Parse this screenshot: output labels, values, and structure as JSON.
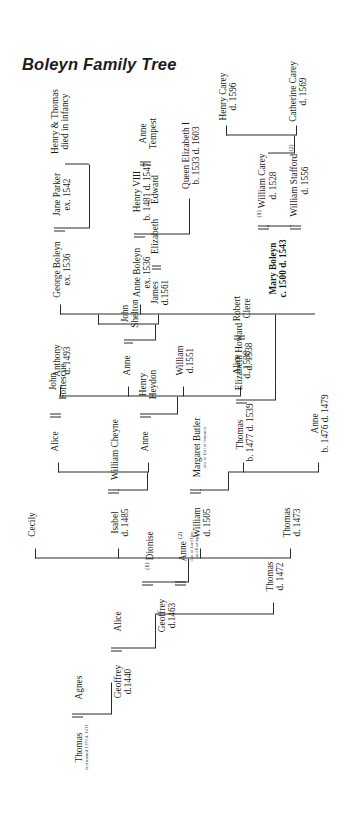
{
  "document": {
    "title": "Boleyn Family Tree",
    "type": "genealogical-chart",
    "orientation": "rotated-90-counterclockwise"
  },
  "people": {
    "thomas_boleyn_1": {
      "name": "Thomas",
      "note": "first named 1370 d. 1411"
    },
    "agnes": {
      "name": "Agnes"
    },
    "geoffrey_1440": {
      "name": "Geoffrey",
      "dates": "d.1440"
    },
    "alice": {
      "name": "Alice"
    },
    "geoffrey_1463": {
      "name": "Geoffrey",
      "dates": "d.1463"
    },
    "dionise": {
      "name": "Dionise",
      "order": "(1)"
    },
    "cecily": {
      "name": "Cecily"
    },
    "anne_hoo": {
      "name": "Anne",
      "order": "(2)",
      "note1": "dau. of Lord Hoo",
      "note2": "and Hastings"
    },
    "thomas_1472": {
      "name": "Thomas",
      "dates": "d. 1472"
    },
    "isabel_1485": {
      "name": "Isabel",
      "dates": "d. 1485"
    },
    "william_cheyne": {
      "name": "William Cheyne"
    },
    "anne_heydon": {
      "name": "Anne"
    },
    "henry_heydon": {
      "name": "Henry",
      "dates": "Heydon"
    },
    "alice_fortescue": {
      "name": "Alice"
    },
    "john_fortescue": {
      "name": "John",
      "dates": "Fortescue"
    },
    "william_1505": {
      "name": "William",
      "dates": "d. 1505"
    },
    "margaret_butler": {
      "name": "Margaret Butler",
      "note": "dau. of Earl of Ormonde"
    },
    "thomas_1473": {
      "name": "Thomas",
      "dates": "d. 1473"
    },
    "anthony_1493": {
      "name": "Anthony",
      "dates": "d. 1493"
    },
    "alice_1538": {
      "name": "Alice",
      "dates": "d. 1538"
    },
    "robert_clere": {
      "name": "Robert",
      "dates": "Clere"
    },
    "william_1551": {
      "name": "William",
      "dates": "d.1551"
    },
    "anne_shelton": {
      "name": "Anne"
    },
    "john_shelton": {
      "name": "John",
      "dates": "Shelton"
    },
    "james_1561": {
      "name": "James",
      "dates": "d.1561"
    },
    "elizabeth_shelton": {
      "name": "Elizabeth"
    },
    "edward": {
      "name": "Edward"
    },
    "anne_tempest": {
      "name": "Anne",
      "dates": "Tempest"
    },
    "thomas_1539": {
      "name": "Thomas",
      "dates": "b. 1477 d. 1539"
    },
    "elizabeth_howard": {
      "name": "Elizabeth Howard",
      "dates": "d. 1538"
    },
    "anne_1479": {
      "name": "Anne",
      "dates": "b. 1476 d. 1479"
    },
    "mary_boleyn": {
      "name": "Mary Boleyn",
      "dates": "c. 1500 d. 1543"
    },
    "william_carey": {
      "name": "William Carey",
      "order": "(1)",
      "dates": "d. 1528"
    },
    "william_stafford": {
      "name": "William Stafford",
      "order": "(2)",
      "dates": "d. 1556"
    },
    "anne_boleyn": {
      "name": "Anne Boleyn",
      "dates": "ex. 1536"
    },
    "henry_viii": {
      "name": "Henry VIII",
      "dates": "b. 1481 d. 1547"
    },
    "george_boleyn": {
      "name": "George Boleyn",
      "dates": "ex. 1536"
    },
    "jane_parker": {
      "name": "Jane Parker",
      "dates": "ex. 1542"
    },
    "catherine_carey": {
      "name": "Catherine Carey",
      "dates": "d. 1569"
    },
    "henry_carey": {
      "name": "Henry Carey",
      "dates": "d. 1596"
    },
    "queen_elizabeth": {
      "name": "Queen Elizabeth I",
      "dates": "b. 1533 d. 1603"
    },
    "henry_thomas": {
      "name": "Henry & Thomas",
      "dates": "died in infancy"
    }
  },
  "colors": {
    "ink": "#1a1a1a",
    "rule": "#2a2a2a",
    "fine_print": "#444444",
    "background": "#ffffff"
  }
}
